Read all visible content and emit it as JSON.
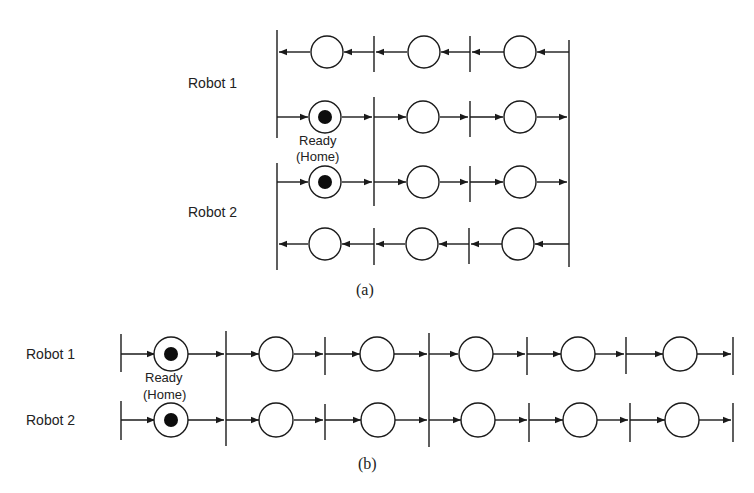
{
  "diagram_a": {
    "caption": "(a)",
    "robot1_label": "Robot 1",
    "robot2_label": "Robot 2",
    "home_label_line1": "Ready",
    "home_label_line2": "(Home)",
    "description": "Petri net with two robots, each having an outbound (right) row and a return (left) row; shared transition synchronizes Robot 1 and Robot 2 after Ready (Home) place",
    "rows": [
      {
        "robot": "Robot 1",
        "direction": "left",
        "places": 3,
        "tokens": [
          false,
          false,
          false
        ]
      },
      {
        "robot": "Robot 1",
        "direction": "right",
        "places": 3,
        "tokens": [
          true,
          false,
          false
        ]
      },
      {
        "robot": "Robot 2",
        "direction": "right",
        "places": 3,
        "tokens": [
          true,
          false,
          false
        ]
      },
      {
        "robot": "Robot 2",
        "direction": "left",
        "places": 3,
        "tokens": [
          false,
          false,
          false
        ]
      }
    ]
  },
  "diagram_b": {
    "caption": "(b)",
    "robot1_label": "Robot 1",
    "robot2_label": "Robot 2",
    "home_label_line1": "Ready",
    "home_label_line2": "(Home)",
    "description": "Linear Petri net for two robots with 6 places each; first place marked (Ready/Home); shared synchronizing transitions after places 1 and 3",
    "rows": [
      {
        "robot": "Robot 1",
        "direction": "right",
        "places": 6,
        "tokens": [
          true,
          false,
          false,
          false,
          false,
          false
        ]
      },
      {
        "robot": "Robot 2",
        "direction": "right",
        "places": 6,
        "tokens": [
          true,
          false,
          false,
          false,
          false,
          false
        ]
      }
    ]
  },
  "colors": {
    "line": "#1a1a1a",
    "token": "#0d0d0d",
    "background": "#ffffff"
  }
}
